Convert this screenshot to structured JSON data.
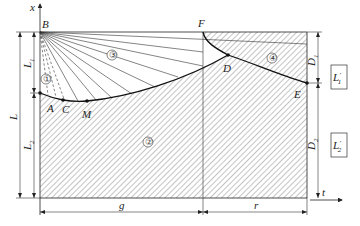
{
  "figure": {
    "axes": {
      "vertical": "x",
      "horizontal": "t"
    },
    "points": {
      "B": "B",
      "F": "F",
      "A": "A",
      "C": "C",
      "M": "M",
      "D": "D",
      "E": "E"
    },
    "regions": {
      "r1": "①",
      "r2": "②",
      "r3": "③",
      "r4": "④"
    },
    "dimensions": {
      "L": "L",
      "L1": "L",
      "L1_sub": "1",
      "L2": "L",
      "L2_sub": "2",
      "g": "g",
      "r": "r",
      "D1": "D",
      "D1_sub": "1",
      "D2": "D",
      "D2_sub": "2"
    },
    "boxes": {
      "top": {
        "main": "L",
        "prime": "′",
        "sub": "1"
      },
      "bottom": {
        "main": "L",
        "prime": "′",
        "sub": "2"
      }
    },
    "colors": {
      "line": "#222222",
      "hatch": "#555555",
      "background": "#ffffff"
    }
  }
}
